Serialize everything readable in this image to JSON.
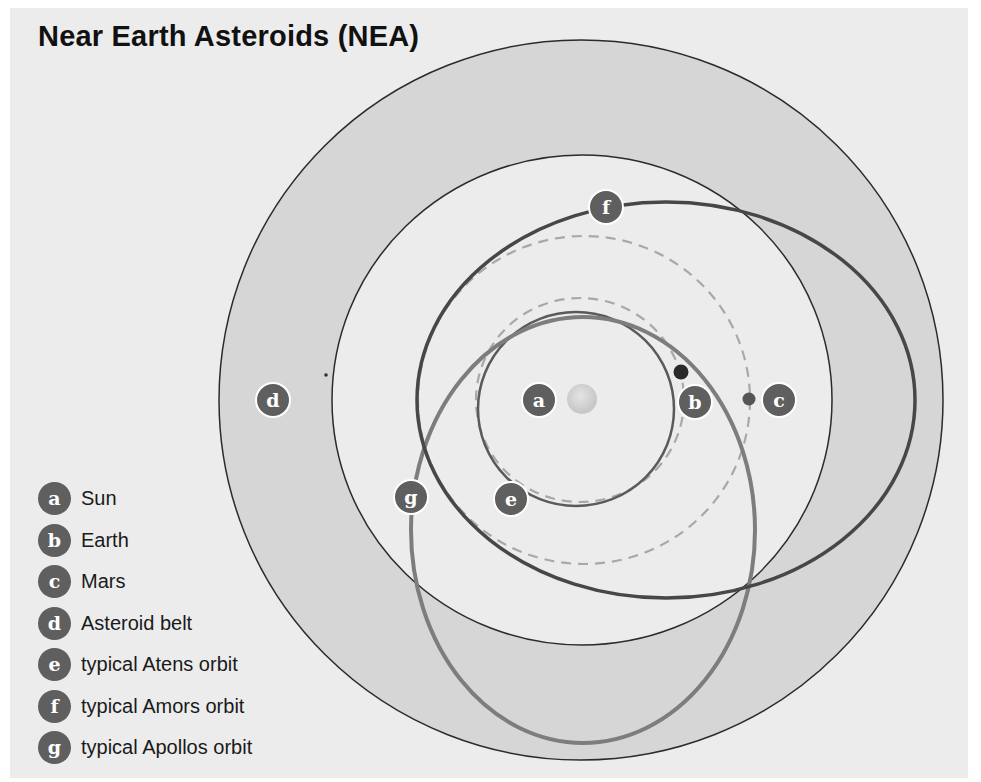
{
  "title": "Near Earth Asteroids (NEA)",
  "colors": {
    "background": "#ececec",
    "belt_fill": "#d6d6d6",
    "badge": "#5f5f5f",
    "amors_orbit": "#474747",
    "apollos_orbit": "#7d7d7d",
    "atens_orbit": "#5a5a5a",
    "dashed_orbit": "#a8a8a8",
    "sun": "#cfcfcf",
    "earth": "#2a2a2a",
    "mars": "#555555"
  },
  "legend": [
    {
      "key": "a",
      "label": "Sun"
    },
    {
      "key": "b",
      "label": "Earth"
    },
    {
      "key": "c",
      "label": "Mars"
    },
    {
      "key": "d",
      "label": "Asteroid belt"
    },
    {
      "key": "e",
      "label": "typical Atens orbit"
    },
    {
      "key": "f",
      "label": "typical Amors orbit"
    },
    {
      "key": "g",
      "label": "typical Apollos orbit"
    }
  ],
  "markers": {
    "a": "a",
    "b": "b",
    "c": "c",
    "d": "d",
    "e": "e",
    "f": "f",
    "g": "g"
  }
}
